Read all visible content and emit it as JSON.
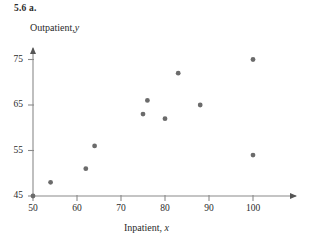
{
  "figure": {
    "caption": "5.6  a."
  },
  "chart_data": {
    "type": "scatter",
    "title": "",
    "xlabel": "Inpatient, x",
    "ylabel": "Outpatient, y",
    "xlabel_text": "Inpatient,",
    "xlabel_var": "x",
    "ylabel_text": "Outpatient,",
    "ylabel_var": "y",
    "xlim": [
      47,
      108
    ],
    "ylim": [
      43.5,
      78
    ],
    "xticks": [
      50,
      60,
      70,
      80,
      90,
      100
    ],
    "yticks": [
      45,
      55,
      65,
      75
    ],
    "xtick_labels": [
      "50",
      "60",
      "70",
      "80",
      "90",
      "100"
    ],
    "ytick_labels": [
      "45",
      "55",
      "65",
      "75"
    ],
    "grid": false,
    "legend": null,
    "marker_color": "#6b6b6b",
    "axis_color": "#8a8a8a",
    "points": [
      {
        "x": 50,
        "y": 45
      },
      {
        "x": 54,
        "y": 48
      },
      {
        "x": 62,
        "y": 51
      },
      {
        "x": 64,
        "y": 56
      },
      {
        "x": 75,
        "y": 63
      },
      {
        "x": 76,
        "y": 66
      },
      {
        "x": 80,
        "y": 62
      },
      {
        "x": 83,
        "y": 72
      },
      {
        "x": 88,
        "y": 65
      },
      {
        "x": 100,
        "y": 54
      },
      {
        "x": 100,
        "y": 75
      }
    ]
  }
}
